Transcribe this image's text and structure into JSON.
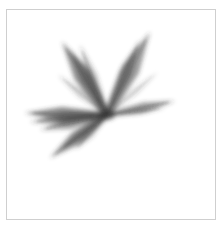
{
  "image": {
    "description": "abstract blurred gray starburst of strokes inside a thin bordered frame",
    "stroke_color": "#3a3a3a",
    "border_color": "#cfcfcf",
    "background": "#ffffff",
    "center": [
      107,
      115
    ],
    "rays": [
      {
        "to": [
          62,
          42
        ],
        "width": 9,
        "opacity": 0.55
      },
      {
        "to": [
          70,
          50
        ],
        "width": 6,
        "opacity": 0.45
      },
      {
        "to": [
          80,
          45
        ],
        "width": 5,
        "opacity": 0.35
      },
      {
        "to": [
          58,
          75
        ],
        "width": 4,
        "opacity": 0.25
      },
      {
        "to": [
          150,
          32
        ],
        "width": 9,
        "opacity": 0.5
      },
      {
        "to": [
          140,
          40
        ],
        "width": 6,
        "opacity": 0.45
      },
      {
        "to": [
          158,
          72
        ],
        "width": 3,
        "opacity": 0.2
      },
      {
        "to": [
          175,
          101
        ],
        "width": 5,
        "opacity": 0.5
      },
      {
        "to": [
          165,
          108
        ],
        "width": 3,
        "opacity": 0.3
      },
      {
        "to": [
          25,
          113
        ],
        "width": 7,
        "opacity": 0.6
      },
      {
        "to": [
          30,
          122
        ],
        "width": 6,
        "opacity": 0.5
      },
      {
        "to": [
          40,
          130
        ],
        "width": 6,
        "opacity": 0.45
      },
      {
        "to": [
          50,
          158
        ],
        "width": 7,
        "opacity": 0.5
      },
      {
        "to": [
          60,
          150
        ],
        "width": 5,
        "opacity": 0.45
      },
      {
        "to": [
          75,
          150
        ],
        "width": 4,
        "opacity": 0.3
      }
    ]
  }
}
